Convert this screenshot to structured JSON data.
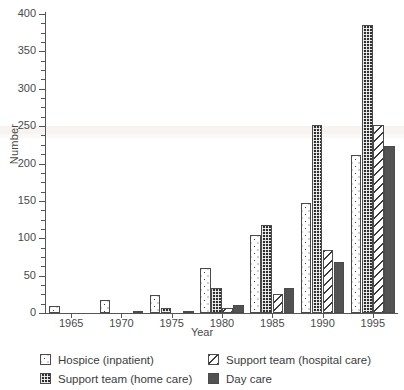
{
  "chart_data": {
    "type": "bar",
    "title": "",
    "subtitle": "",
    "xlabel": "Year",
    "ylabel": "Number",
    "categories": [
      "1965",
      "1970",
      "1975",
      "1980",
      "1985",
      "1990",
      "1995"
    ],
    "ylim": [
      0,
      400
    ],
    "yticks": [
      0,
      50,
      100,
      150,
      200,
      250,
      300,
      350,
      400
    ],
    "ytick_labels": [
      "0",
      "50",
      "100",
      "150",
      "200",
      "250",
      "300",
      "350",
      "400"
    ],
    "y_minor_tick_step": 12.5,
    "grid": false,
    "legend_position": "below-axes",
    "legend_columns": 2,
    "series": [
      {
        "name": "Hospice (inpatient)",
        "pattern": "sparse-dots",
        "color": "#ffffff",
        "values": [
          10,
          17,
          24,
          60,
          105,
          147,
          212
        ]
      },
      {
        "name": "Support team (home care)",
        "pattern": "dense-checkerboard",
        "color": "#2f2f2f",
        "values": [
          0,
          0,
          7,
          34,
          118,
          251,
          385
        ]
      },
      {
        "name": "Support team (hospital care)",
        "pattern": "diagonal-hatch",
        "color": "#ffffff",
        "values": [
          0,
          0,
          0,
          7,
          25,
          84,
          252
        ]
      },
      {
        "name": "Day care",
        "pattern": "solid-grey",
        "color": "#5b5b5b",
        "values": [
          0,
          3,
          3,
          11,
          34,
          68,
          223
        ]
      }
    ]
  },
  "axes": {
    "ylabel": "Number",
    "xlabel": "Year"
  },
  "legend": {
    "entries": [
      {
        "label": "Hospice (inpatient)",
        "swatch": "sparse-dots-swatch"
      },
      {
        "label": "Support team (hospital care)",
        "swatch": "diagonal-hatch-swatch"
      },
      {
        "label": "Support team (home care)",
        "swatch": "dense-checkerboard-swatch"
      },
      {
        "label": "Day care",
        "swatch": "solid-grey-swatch"
      }
    ]
  }
}
